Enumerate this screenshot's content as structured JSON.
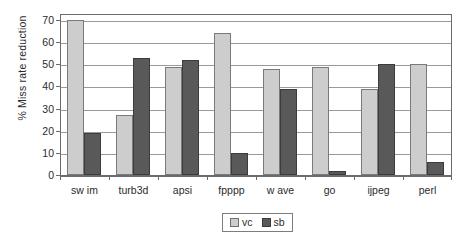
{
  "chart_data": {
    "type": "bar",
    "title": "",
    "xlabel": "",
    "ylabel": "% Miss rate reduction",
    "ylim": [
      0,
      70
    ],
    "yticks": [
      0,
      10,
      20,
      30,
      40,
      50,
      60,
      70
    ],
    "ytick_labels": [
      "0",
      "10",
      "20",
      "30",
      "40",
      "50",
      "60",
      "70"
    ],
    "grid": "horizontal",
    "legend_position": "bottom-center",
    "categories": [
      "sw im",
      "turb3d",
      "apsi",
      "fpppp",
      "w ave",
      "go",
      "ijpeg",
      "perl"
    ],
    "series": [
      {
        "name": "vc",
        "color": "#cdcdcd",
        "values": [
          70,
          27,
          49,
          64,
          48,
          49,
          39,
          50
        ]
      },
      {
        "name": "sb",
        "color": "#595959",
        "values": [
          19,
          53,
          52,
          10,
          39,
          2,
          50,
          6
        ]
      }
    ]
  },
  "legend": {
    "items": [
      {
        "label": "vc"
      },
      {
        "label": "sb"
      }
    ]
  }
}
